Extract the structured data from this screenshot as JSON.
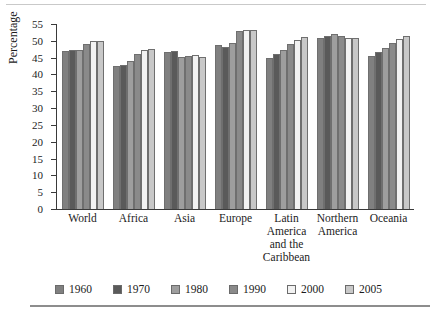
{
  "chart_data": {
    "type": "bar",
    "title": "",
    "xlabel": "",
    "ylabel": "Percentage",
    "ylim": [
      0,
      55
    ],
    "ytick_step": 5,
    "yticks": [
      0,
      5,
      10,
      15,
      20,
      25,
      30,
      35,
      40,
      45,
      50,
      55
    ],
    "grid": false,
    "legend_position": "bottom",
    "categories": [
      "World",
      "Africa",
      "Asia",
      "Europe",
      "Latin America and the Caribbean",
      "Northern America",
      "Oceania"
    ],
    "category_label_lines": [
      [
        "World"
      ],
      [
        "Africa"
      ],
      [
        "Asia"
      ],
      [
        "Europe"
      ],
      [
        "Latin",
        "America",
        "and the",
        "Caribbean"
      ],
      [
        "Northern",
        "America"
      ],
      [
        "Oceania"
      ]
    ],
    "series": [
      {
        "name": "1960",
        "color": "#808080",
        "values": [
          47.0,
          42.4,
          46.6,
          48.8,
          45.0,
          50.8,
          45.6
        ]
      },
      {
        "name": "1970",
        "color": "#5a5a5a",
        "values": [
          47.4,
          42.9,
          47.0,
          48.3,
          46.2,
          51.5,
          46.6
        ]
      },
      {
        "name": "1980",
        "color": "#9e9e9e",
        "values": [
          47.3,
          44.1,
          45.3,
          49.5,
          47.4,
          52.1,
          47.9
        ]
      },
      {
        "name": "1990",
        "color": "#8a8a8a",
        "values": [
          49.0,
          46.1,
          45.6,
          52.9,
          49.0,
          51.4,
          49.4
        ]
      },
      {
        "name": "2000",
        "color": "#f2f2f2",
        "values": [
          50.0,
          47.3,
          45.9,
          53.1,
          50.3,
          50.8,
          50.4
        ]
      },
      {
        "name": "2005",
        "color": "#c8c8c8",
        "values": [
          50.0,
          47.6,
          45.1,
          53.1,
          51.0,
          50.8,
          51.4
        ]
      }
    ]
  },
  "legend": {
    "entries": [
      {
        "label": "1960",
        "color": "#808080"
      },
      {
        "label": "1970",
        "color": "#5a5a5a"
      },
      {
        "label": "1980",
        "color": "#9e9e9e"
      },
      {
        "label": "1990",
        "color": "#8a8a8a"
      },
      {
        "label": "2000",
        "color": "#f2f2f2"
      },
      {
        "label": "2005",
        "color": "#c8c8c8"
      }
    ]
  }
}
